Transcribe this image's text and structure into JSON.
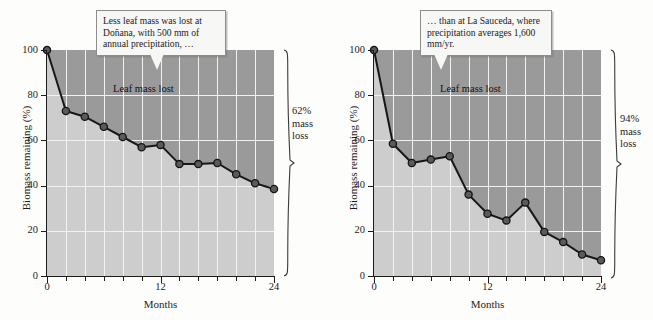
{
  "figure": {
    "panels": [
      {
        "id": "donana",
        "callout": "Less leaf mass was lost at Doñana, with 500 mm of annual precipitation, …",
        "inner_label": "Leaf mass lost",
        "bracket_line1": "62%",
        "bracket_line2": "mass",
        "bracket_line3": "loss",
        "chart": {
          "type": "line",
          "title": "",
          "xlabel": "Months",
          "ylabel": "Biomass remaining (%)",
          "xlim": [
            0,
            24
          ],
          "ylim": [
            0,
            100
          ],
          "xticks_major": [
            0,
            12,
            24
          ],
          "xticks_minor": [
            2,
            4,
            6,
            8,
            10,
            14,
            16,
            18,
            20,
            22
          ],
          "yticks": [
            0,
            20,
            40,
            60,
            80,
            100
          ],
          "grid": true,
          "legend": "none",
          "x": [
            0,
            2,
            4,
            6,
            8,
            10,
            12,
            14,
            16,
            18,
            20,
            22,
            24
          ],
          "y": [
            100,
            73,
            70.5,
            66,
            61.5,
            57,
            58,
            49.5,
            49.5,
            50,
            45,
            41,
            38.5
          ]
        }
      },
      {
        "id": "la-sauceda",
        "callout": "… than at La Sauceda, where precipitation averages 1,600 mm/yr.",
        "inner_label": "Leaf mass lost",
        "bracket_line1": "94%",
        "bracket_line2": "mass",
        "bracket_line3": "loss",
        "chart": {
          "type": "line",
          "title": "",
          "xlabel": "Months",
          "ylabel": "Biomass remaining (%)",
          "xlim": [
            0,
            24
          ],
          "ylim": [
            0,
            100
          ],
          "xticks_major": [
            0,
            12,
            24
          ],
          "xticks_minor": [
            2,
            4,
            6,
            8,
            10,
            14,
            16,
            18,
            20,
            22
          ],
          "yticks": [
            0,
            20,
            40,
            60,
            80,
            100
          ],
          "grid": true,
          "legend": "none",
          "x": [
            0,
            2,
            4,
            6,
            8,
            10,
            12,
            14,
            16,
            18,
            20,
            22,
            24
          ],
          "y": [
            100,
            58.5,
            50,
            51.5,
            53,
            36,
            27.5,
            24.5,
            32.5,
            19.5,
            15,
            9.5,
            7
          ]
        }
      }
    ]
  },
  "chart_data": [
    {
      "type": "line",
      "title": "Doñana — 500 mm annual precipitation",
      "xlabel": "Months",
      "ylabel": "Biomass remaining (%)",
      "xlim": [
        0,
        24
      ],
      "ylim": [
        0,
        100
      ],
      "x": [
        0,
        2,
        4,
        6,
        8,
        10,
        12,
        14,
        16,
        18,
        20,
        22,
        24
      ],
      "values": [
        100,
        73,
        70.5,
        66,
        61.5,
        57,
        58,
        49.5,
        49.5,
        50,
        45,
        41,
        38.5
      ],
      "xticks": [
        0,
        12,
        24
      ],
      "yticks": [
        0,
        20,
        40,
        60,
        80,
        100
      ],
      "grid": true,
      "legend": "none",
      "annotations": [
        "Less leaf mass was lost at Doñana, with 500 mm of annual precipitation, …",
        "Leaf mass lost",
        "62% mass loss"
      ]
    },
    {
      "type": "line",
      "title": "La Sauceda — 1,600 mm/yr precipitation",
      "xlabel": "Months",
      "ylabel": "Biomass remaining (%)",
      "xlim": [
        0,
        24
      ],
      "ylim": [
        0,
        100
      ],
      "x": [
        0,
        2,
        4,
        6,
        8,
        10,
        12,
        14,
        16,
        18,
        20,
        22,
        24
      ],
      "values": [
        100,
        58.5,
        50,
        51.5,
        53,
        36,
        27.5,
        24.5,
        32.5,
        19.5,
        15,
        9.5,
        7
      ],
      "xticks": [
        0,
        12,
        24
      ],
      "yticks": [
        0,
        20,
        40,
        60,
        80,
        100
      ],
      "grid": true,
      "legend": "none",
      "annotations": [
        "… than at La Sauceda, where precipitation averages 1,600 mm/yr.",
        "Leaf mass lost",
        "94% mass loss"
      ]
    }
  ]
}
